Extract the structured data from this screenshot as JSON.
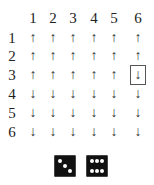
{
  "grid": {
    "col_headers": [
      "1",
      "2",
      "3",
      "4",
      "5",
      "6"
    ],
    "row_headers": [
      "1",
      "2",
      "3",
      "4",
      "5",
      "6"
    ],
    "rows": [
      [
        "↑",
        "↑",
        "↑",
        "↑",
        "↑",
        "↑"
      ],
      [
        "↑",
        "↑",
        "↑",
        "↑",
        "↑",
        "↑"
      ],
      [
        "↑",
        "↑",
        "↑",
        "↑",
        "↑",
        "↓"
      ],
      [
        "↓",
        "↓",
        "↓",
        "↓",
        "↓",
        "↓"
      ],
      [
        "↓",
        "↓",
        "↓",
        "↓",
        "↓",
        "↓"
      ],
      [
        "↓",
        "↓",
        "↓",
        "↓",
        "↓",
        "↓"
      ]
    ],
    "highlighted_cell": {
      "row": 3,
      "col": 6
    }
  },
  "dice": [
    {
      "value": 3,
      "icon": "die-three-icon"
    },
    {
      "value": 6,
      "icon": "die-six-icon"
    }
  ]
}
